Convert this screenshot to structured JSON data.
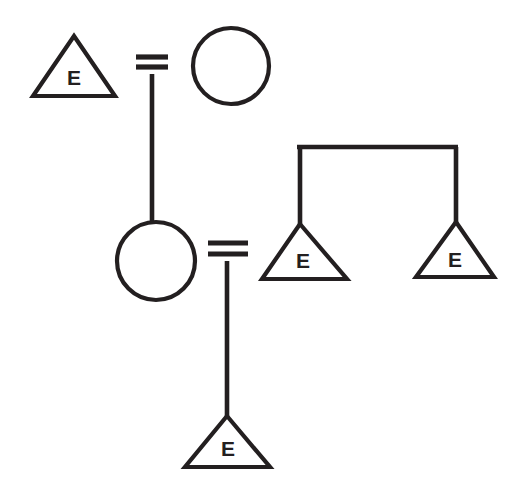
{
  "diagram": {
    "type": "pedigree",
    "background_color": "#ffffff",
    "stroke_color": "#231f20",
    "symbols": {
      "triangle": "pregnancy-or-unspecified-sex",
      "circle": "female",
      "double-line": "consanguineous-or-mating-union"
    },
    "nodes": [
      {
        "id": "n1",
        "shape": "triangle",
        "label": "E",
        "generation": 1,
        "cx": 74,
        "cy": 70,
        "width": 78,
        "height": 57
      },
      {
        "id": "n2",
        "shape": "circle",
        "label": "",
        "generation": 1,
        "cx": 231,
        "cy": 66,
        "r": 38
      },
      {
        "id": "n3",
        "shape": "circle",
        "label": "",
        "generation": 2,
        "cx": 156,
        "cy": 261,
        "r": 39
      },
      {
        "id": "n4",
        "shape": "triangle",
        "label": "E",
        "generation": 2,
        "cx": 305,
        "cy": 252,
        "width": 86,
        "height": 55
      },
      {
        "id": "n5",
        "shape": "triangle",
        "label": "E",
        "generation": 2,
        "cx": 455,
        "cy": 250,
        "width": 80,
        "height": 55
      },
      {
        "id": "n6",
        "shape": "triangle",
        "label": "E",
        "generation": 3,
        "cx": 227,
        "cy": 443,
        "width": 85,
        "height": 52
      }
    ],
    "unions": [
      {
        "id": "u1",
        "partners": [
          "n1",
          "n2"
        ],
        "marker": "double-line",
        "x": 152,
        "y_top": 57,
        "y_bottom": 67,
        "bar_x_start": 136,
        "bar_x_end": 168,
        "descent_to": "n3"
      },
      {
        "id": "u2",
        "partners": [
          "n3",
          "n4"
        ],
        "marker": "double-line",
        "x": 227,
        "y_top": 243,
        "y_bottom": 254,
        "bar_x_start": 208,
        "bar_x_end": 248,
        "descent_to": "n6"
      }
    ],
    "sibship": {
      "id": "s1",
      "bar_y": 147,
      "bar_x_start": 300,
      "bar_x_end": 456,
      "children": [
        "n4",
        "n5"
      ]
    },
    "labels": {
      "node_letter": "E"
    },
    "counts": {
      "triangles": 4,
      "circles": 2,
      "unions": 2,
      "sibship_bars": 1
    }
  }
}
